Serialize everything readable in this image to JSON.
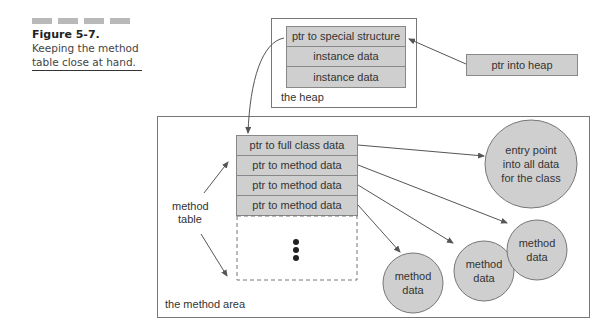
{
  "caption": {
    "figure_label": "Figure 5-7.",
    "line1": "Keeping the method",
    "line2": "table close at hand."
  },
  "heap": {
    "label": "the heap",
    "entries": [
      "ptr to special structure",
      "instance data",
      "instance data"
    ]
  },
  "heap_pointer": {
    "label": "ptr into heap"
  },
  "method_area": {
    "label": "the method area",
    "table_label_line1": "method",
    "table_label_line2": "table",
    "entries": [
      "ptr to full class data",
      "ptr to method data",
      "ptr to method data",
      "ptr to method data"
    ],
    "continuation": "ellipsis-dots"
  },
  "nodes": {
    "entry_point": [
      "entry point",
      "into all data",
      "for the class"
    ],
    "method_data": [
      [
        "method",
        "data"
      ],
      [
        "method",
        "data"
      ],
      [
        "method",
        "data"
      ]
    ]
  },
  "colors": {
    "cell_fill": "#cfcfcf",
    "border": "#777777",
    "arrow": "#555555"
  }
}
